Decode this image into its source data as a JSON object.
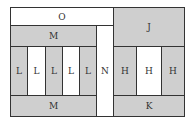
{
  "diagram": {
    "type": "floor-plan-block-layout",
    "regions": [
      {
        "id": "O",
        "label": "O",
        "fill": "white",
        "x": 10,
        "y": 7,
        "w": 103,
        "h": 18
      },
      {
        "id": "J",
        "label": "J",
        "fill": "gray",
        "x": 113,
        "y": 7,
        "w": 72,
        "h": 39
      },
      {
        "id": "M_top",
        "label": "M",
        "fill": "gray",
        "x": 10,
        "y": 25,
        "w": 86,
        "h": 21
      },
      {
        "id": "N",
        "label": "N",
        "fill": "white",
        "x": 96,
        "y": 25,
        "w": 17,
        "h": 92
      },
      {
        "id": "L1",
        "label": "L",
        "fill": "gray",
        "x": 10,
        "y": 46,
        "w": 17,
        "h": 49
      },
      {
        "id": "L2",
        "label": "L",
        "fill": "white",
        "x": 27,
        "y": 46,
        "w": 18,
        "h": 49
      },
      {
        "id": "L3",
        "label": "L",
        "fill": "gray",
        "x": 45,
        "y": 46,
        "w": 17,
        "h": 49
      },
      {
        "id": "L4",
        "label": "L",
        "fill": "white",
        "x": 62,
        "y": 46,
        "w": 17,
        "h": 49
      },
      {
        "id": "L5",
        "label": "L",
        "fill": "gray",
        "x": 79,
        "y": 46,
        "w": 17,
        "h": 49
      },
      {
        "id": "H1",
        "label": "H",
        "fill": "gray",
        "x": 113,
        "y": 46,
        "w": 23,
        "h": 49
      },
      {
        "id": "H2",
        "label": "H",
        "fill": "white",
        "x": 136,
        "y": 46,
        "w": 25,
        "h": 49
      },
      {
        "id": "H3",
        "label": "H",
        "fill": "gray",
        "x": 161,
        "y": 46,
        "w": 24,
        "h": 49
      },
      {
        "id": "M_bottom",
        "label": "M",
        "fill": "gray",
        "x": 10,
        "y": 95,
        "w": 86,
        "h": 22
      },
      {
        "id": "K",
        "label": "K",
        "fill": "gray",
        "x": 113,
        "y": 95,
        "w": 72,
        "h": 22
      }
    ],
    "colors": {
      "gray": "#cfcfcf",
      "white": "#ffffff",
      "border": "#333333"
    }
  }
}
